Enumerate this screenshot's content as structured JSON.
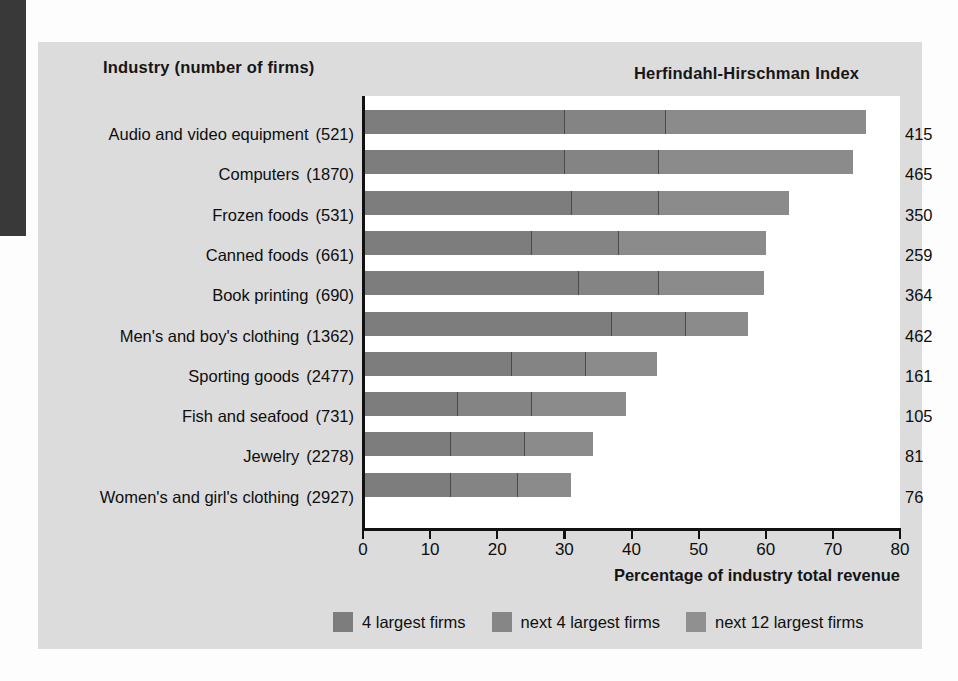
{
  "figure": {
    "column_header_left": "Industry (number of firms)",
    "column_header_right": "Herfindahl-Hirschman Index"
  },
  "chart_data": {
    "type": "bar",
    "orientation": "horizontal",
    "stacked": true,
    "title": "",
    "xlabel": "Percentage of industry total revenue",
    "ylabel": "Industry (number of firms)",
    "xlim": [
      0,
      80
    ],
    "xticks": [
      0,
      10,
      20,
      30,
      40,
      50,
      60,
      70,
      80
    ],
    "grid": false,
    "legend_position": "bottom",
    "categories": [
      "Audio and video equipment",
      "Computers",
      "Frozen foods",
      "Canned foods",
      "Book printing",
      "Men's and boy's clothing",
      "Sporting goods",
      "Fish and seafood",
      "Jewelry",
      "Women's and girl's clothing"
    ],
    "firm_counts": [
      "(521)",
      "(1870)",
      "(531)",
      "(661)",
      "(690)",
      "(1362)",
      "(2477)",
      "(731)",
      "(2278)",
      "(2927)"
    ],
    "series": [
      {
        "name": "4 largest firms",
        "color": "#7d7d7d",
        "values": [
          30,
          30,
          31,
          25,
          32,
          37,
          22,
          14,
          13,
          13
        ]
      },
      {
        "name": "next 4 largest firms",
        "color": "#868686",
        "values": [
          15,
          14,
          13,
          13,
          12,
          11,
          11,
          11,
          11,
          10
        ]
      },
      {
        "name": "next 12 largest firms",
        "color": "#909090",
        "values": [
          30,
          29,
          19.4,
          22,
          15.8,
          9.4,
          10.8,
          14.2,
          10.2,
          8
        ]
      }
    ],
    "totals": [
      75,
      73,
      63.4,
      60,
      59.8,
      57.4,
      43.8,
      39.2,
      34.2,
      31
    ],
    "hhi_label": "Herfindahl-Hirschman Index",
    "hhi_values": [
      415,
      465,
      350,
      259,
      364,
      462,
      161,
      105,
      81,
      76
    ]
  }
}
